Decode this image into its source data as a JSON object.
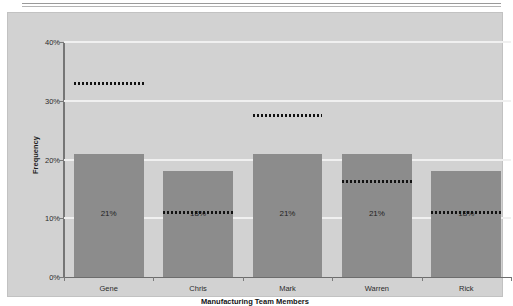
{
  "chart_data": {
    "type": "bar",
    "title": "",
    "xlabel": "Manufacturing Team Members",
    "ylabel": "Frequency",
    "categories": [
      "Gene",
      "Chris",
      "Mark",
      "Warren",
      "Rick"
    ],
    "values": [
      21,
      18,
      21,
      21,
      18
    ],
    "value_labels": [
      "21%",
      "18%",
      "21%",
      "21%",
      "18%"
    ],
    "ylim": [
      0,
      40
    ],
    "ytick_values": [
      0,
      10,
      20,
      30,
      40
    ],
    "ytick_labels": [
      "0%",
      "10%",
      "20%",
      "30%",
      "40%"
    ],
    "grid": "horizontal-white",
    "legend": "none",
    "series": [
      {
        "name": "Frequency",
        "values": [
          21,
          18,
          21,
          21,
          18
        ]
      },
      {
        "name": "Dotted marker",
        "values": [
          33,
          11,
          27.5,
          16.4,
          11
        ]
      }
    ],
    "annotations": [
      {
        "category": "Gene",
        "type": "dotted-line",
        "value": 33
      },
      {
        "category": "Chris",
        "type": "dotted-line",
        "value": 11
      },
      {
        "category": "Mark",
        "type": "dotted-line",
        "value": 27.5
      },
      {
        "category": "Warren",
        "type": "dotted-line",
        "value": 16.4
      },
      {
        "category": "Rick",
        "type": "dotted-line",
        "value": 11
      }
    ],
    "colors": {
      "bar": "#8c8c8c",
      "plot_background": "#d2d2d2",
      "gridline": "#f0f0f0",
      "axis": "#767676",
      "dotted_marker": "#121212",
      "page_background": "#ffffff"
    }
  }
}
